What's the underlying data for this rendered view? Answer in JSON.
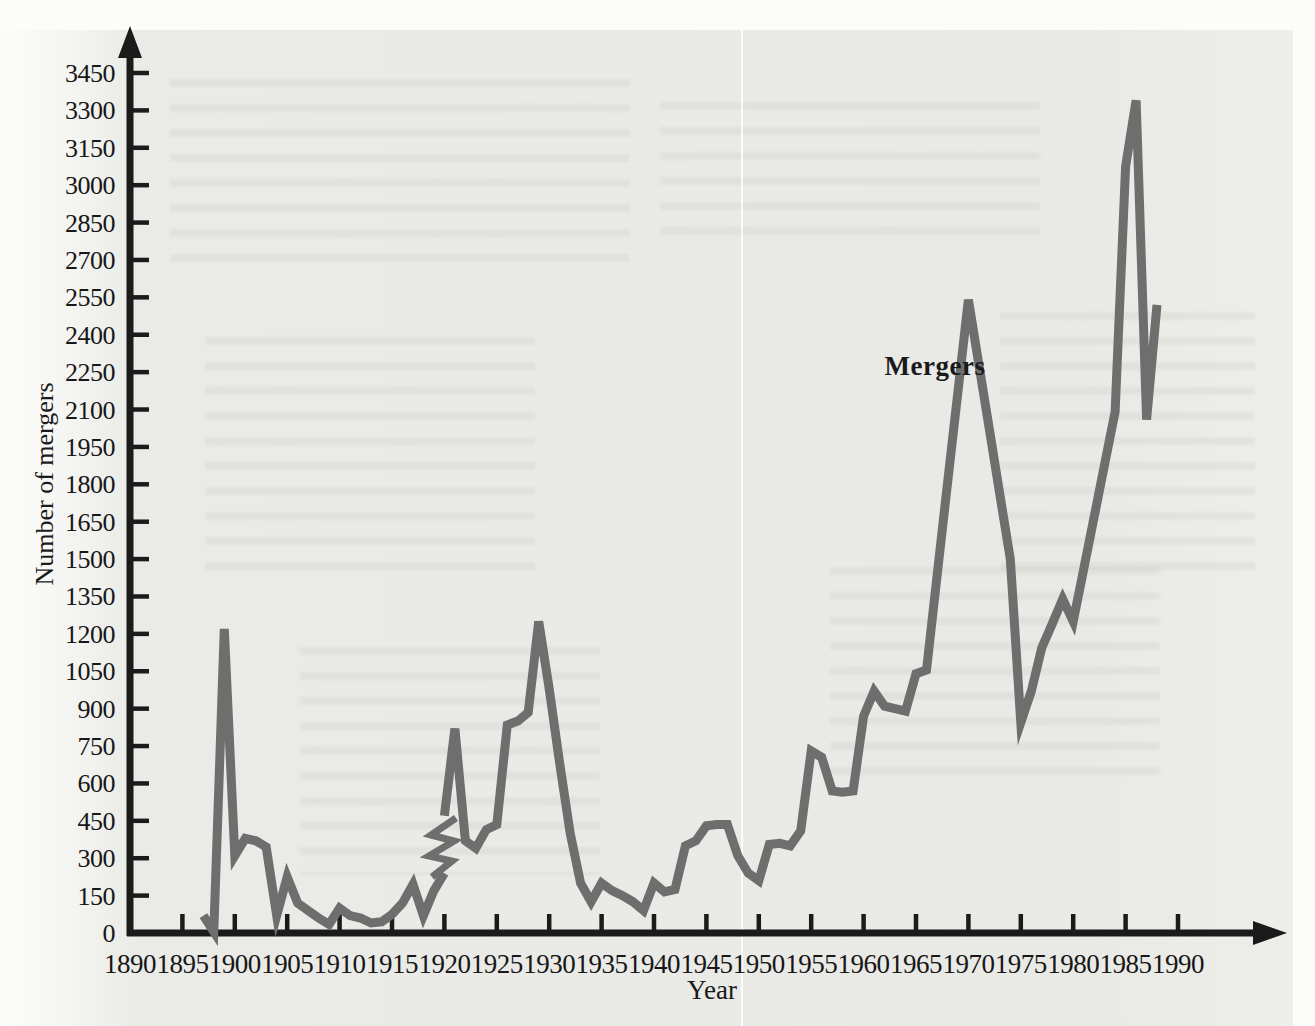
{
  "chart_data": {
    "type": "line",
    "title": "",
    "xlabel": "Year",
    "ylabel": "Number of mergers",
    "annotation": {
      "text": "Mergers",
      "x": 1962,
      "y": 2280
    },
    "xlim": [
      1890,
      1990
    ],
    "ylim": [
      0,
      3450
    ],
    "grid": false,
    "legend_position": "none",
    "x_ticks": [
      1890,
      1895,
      1900,
      1905,
      1910,
      1915,
      1920,
      1925,
      1930,
      1935,
      1940,
      1945,
      1950,
      1955,
      1960,
      1965,
      1970,
      1975,
      1980,
      1985,
      1990
    ],
    "y_ticks": [
      0,
      150,
      300,
      450,
      600,
      750,
      900,
      1050,
      1200,
      1350,
      1500,
      1650,
      1800,
      1950,
      2100,
      2250,
      2400,
      2550,
      2700,
      2850,
      3000,
      3150,
      3300,
      3450
    ],
    "series": [
      {
        "name": "Mergers, early series (1897-1920)",
        "x": [
          1897,
          1898,
          1899,
          1900,
          1901,
          1902,
          1903,
          1904,
          1905,
          1906,
          1907,
          1908,
          1909,
          1910,
          1911,
          1912,
          1913,
          1914,
          1915,
          1916,
          1917,
          1918,
          1919,
          1920
        ],
        "values": [
          70,
          5,
          1220,
          310,
          380,
          370,
          345,
          70,
          225,
          120,
          90,
          60,
          35,
          100,
          70,
          60,
          40,
          45,
          75,
          120,
          195,
          70,
          170,
          240
        ]
      },
      {
        "name": "Mergers, later series (1920-1988)",
        "x": [
          1920,
          1921,
          1922,
          1923,
          1924,
          1925,
          1926,
          1927,
          1928,
          1929,
          1930,
          1931,
          1932,
          1933,
          1934,
          1935,
          1936,
          1937,
          1938,
          1939,
          1940,
          1941,
          1942,
          1943,
          1944,
          1945,
          1946,
          1947,
          1948,
          1949,
          1950,
          1951,
          1952,
          1953,
          1954,
          1955,
          1956,
          1957,
          1958,
          1959,
          1960,
          1961,
          1962,
          1963,
          1964,
          1965,
          1966,
          1967,
          1968,
          1969,
          1970,
          1971,
          1972,
          1973,
          1974,
          1975,
          1976,
          1977,
          1978,
          1979,
          1980,
          1981,
          1982,
          1983,
          1984,
          1985,
          1986,
          1987,
          1988
        ],
        "values": [
          470,
          820,
          370,
          340,
          415,
          435,
          835,
          850,
          885,
          1250,
          980,
          680,
          400,
          200,
          125,
          200,
          170,
          150,
          125,
          90,
          200,
          165,
          175,
          350,
          370,
          430,
          435,
          435,
          310,
          240,
          210,
          355,
          360,
          350,
          410,
          730,
          705,
          570,
          565,
          570,
          870,
          970,
          910,
          900,
          890,
          1040,
          1055,
          1430,
          1800,
          2170,
          2540,
          2280,
          2020,
          1760,
          1500,
          845,
          970,
          1145,
          1240,
          1340,
          1250,
          1460,
          1670,
          1880,
          2090,
          3075,
          3340,
          2060,
          2520
        ]
      }
    ],
    "break_marker": {
      "year": 1920,
      "style": "zigzag",
      "note": "discontinuity between the two merger data series"
    }
  },
  "colors": {
    "axis": "#1b1b1b",
    "line": "#6e6e6e",
    "text": "#1a1a1a",
    "panel": "#e9e9e6",
    "page": "#fcfcfa"
  }
}
